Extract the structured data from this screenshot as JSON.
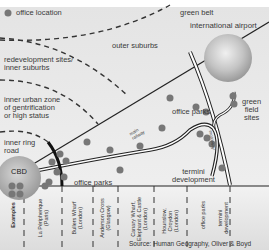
{
  "legend": {
    "marker_label": "office location",
    "marker_color": "#7a7a7a"
  },
  "zones": {
    "green_belt": "green belt",
    "outer_suburbs": "outer suburbs",
    "redevelopment": "redevelopment sites/\ninner suburbs",
    "inner_urban": "inner urban zone\nof gentrification\nor high status",
    "inner_ring": "inner ring\nroad",
    "cbd": "CBD"
  },
  "features": {
    "airport": "international airport",
    "green_field": "green\nfield\nsites",
    "office_parks_upper": "office parks",
    "office_parks_lower": "office parks",
    "termini": "termini\ndevelopment",
    "main_railway": "main\nrailway",
    "motorway": "motorway"
  },
  "examples": {
    "header": "Examples",
    "items": [
      "La Péripherique\n(Paris)",
      "Bullers Wharf\n(London)",
      "Anderson Cross\n(Glasgow)",
      "Canary Wharf,\nElephant & Castle\n(London)",
      "Hounslow,\nCroydon\n(London)",
      "office parks",
      "termini\ndevelopment"
    ]
  },
  "source": "Source: Human Geography, Oliver & Boyd",
  "colors": {
    "background_top": "#e6e6e6",
    "background_bottom": "#f4f4f4",
    "dot": "#777777",
    "line": "#222222"
  }
}
